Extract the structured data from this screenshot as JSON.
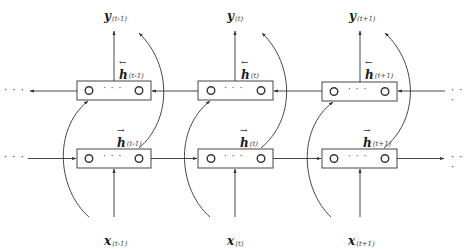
{
  "diagram": {
    "type": "bidirectional-rnn",
    "colors": {
      "stroke": "#333333",
      "background": "#ffffff"
    },
    "ellipsis": "· · ·",
    "inner_ellipsis": "· · ·",
    "timesteps": [
      {
        "output": {
          "symbol": "y",
          "sub": "(t-1)"
        },
        "backward_state": {
          "symbol": "h",
          "arrow": "←",
          "sub": "(t-1)"
        },
        "forward_state": {
          "symbol": "h",
          "arrow": "→",
          "sub": "(t-1)"
        },
        "input": {
          "symbol": "x",
          "sub": "(t-1)"
        }
      },
      {
        "output": {
          "symbol": "y",
          "sub": "(t)"
        },
        "backward_state": {
          "symbol": "h",
          "arrow": "←",
          "sub": "(t)"
        },
        "forward_state": {
          "symbol": "h",
          "arrow": "→",
          "sub": "(t)"
        },
        "input": {
          "symbol": "x",
          "sub": "(t)"
        }
      },
      {
        "output": {
          "symbol": "y",
          "sub": "(t+1)"
        },
        "backward_state": {
          "symbol": "h",
          "arrow": "←",
          "sub": "(t+1)"
        },
        "forward_state": {
          "symbol": "h",
          "arrow": "→",
          "sub": "(t+1)"
        },
        "input": {
          "symbol": "x",
          "sub": "(t+1)"
        }
      }
    ]
  }
}
